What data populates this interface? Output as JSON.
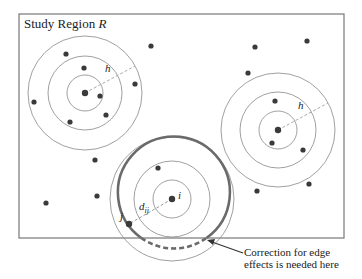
{
  "title": {
    "text": "Study Region ",
    "var": "R"
  },
  "labels": {
    "h_left": "h",
    "h_right": "h",
    "i": "i",
    "dij_d": "d",
    "dij_sub": "ij",
    "j": "j"
  },
  "annotation": {
    "line1": "Correction for edge",
    "line2": "effects is needed here"
  },
  "colors": {
    "frame": "#777777",
    "circle": "#888888",
    "point": "#3a3a3a",
    "thick_circle": "#6a6a6a"
  },
  "region": {
    "x": 19,
    "y": 14,
    "width": 325,
    "height": 224
  },
  "clusters": [
    {
      "name": "left",
      "cx": 85,
      "cy": 93,
      "radii": [
        18,
        37,
        57
      ]
    },
    {
      "name": "right",
      "cx": 278,
      "cy": 130,
      "radii": [
        19,
        38,
        57
      ]
    },
    {
      "name": "bottom",
      "cx": 172,
      "cy": 199,
      "radii": [
        19,
        38,
        62
      ],
      "thick_radius": 56
    }
  ],
  "points": [
    [
      66,
      54
    ],
    [
      84,
      68
    ],
    [
      100,
      96
    ],
    [
      135,
      84
    ],
    [
      34,
      102
    ],
    [
      106,
      115
    ],
    [
      70,
      122
    ],
    [
      151,
      46
    ],
    [
      255,
      47
    ],
    [
      307,
      41
    ],
    [
      248,
      73
    ],
    [
      275,
      101
    ],
    [
      272,
      143
    ],
    [
      303,
      150
    ],
    [
      309,
      184
    ],
    [
      257,
      191
    ],
    [
      95,
      160
    ],
    [
      97,
      196
    ],
    [
      46,
      203
    ],
    [
      158,
      168
    ],
    [
      129,
      224
    ]
  ]
}
